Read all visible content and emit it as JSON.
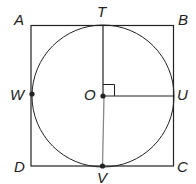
{
  "figure": {
    "type": "square with inscribed circle",
    "square_vertices": {
      "A": "top-left",
      "B": "top-right",
      "C": "bottom-right",
      "D": "bottom-left"
    },
    "circle_center": "O",
    "tangent_points": {
      "T": "top",
      "U": "right",
      "V": "bottom",
      "W": "left"
    },
    "segments": [
      "OT",
      "OU",
      "OV"
    ],
    "right_angle_at": "O (between OT and OU)",
    "points_marked": [
      "W",
      "O",
      "V"
    ]
  },
  "labels": {
    "A": "A",
    "B": "B",
    "C": "C",
    "D": "D",
    "T": "T",
    "U": "U",
    "V": "V",
    "W": "W",
    "O": "O"
  },
  "colors": {
    "stroke": "#222222",
    "ov_segment": "#888888"
  }
}
